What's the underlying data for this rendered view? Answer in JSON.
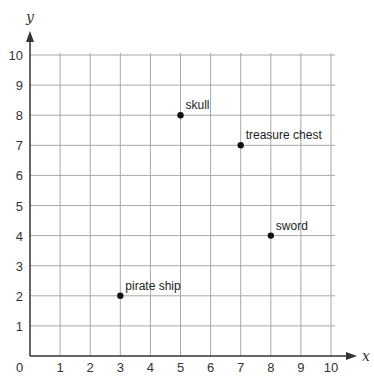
{
  "chart_data": {
    "type": "scatter",
    "title": "",
    "xlabel": "x",
    "ylabel": "y",
    "xlim": [
      0,
      10
    ],
    "ylim": [
      0,
      10
    ],
    "grid": true,
    "x_ticks": [
      "1",
      "2",
      "3",
      "4",
      "5",
      "6",
      "7",
      "8",
      "9",
      "10"
    ],
    "y_ticks": [
      "1",
      "2",
      "3",
      "4",
      "5",
      "6",
      "7",
      "8",
      "9",
      "10"
    ],
    "origin_label": "0",
    "points": [
      {
        "label": "skull",
        "x": 5,
        "y": 8
      },
      {
        "label": "treasure chest",
        "x": 7,
        "y": 7
      },
      {
        "label": "sword",
        "x": 8,
        "y": 4
      },
      {
        "label": "pirate ship",
        "x": 3,
        "y": 2
      }
    ]
  },
  "colors": {
    "grid": "#a8a8a8",
    "axis": "#333333",
    "point": "#111111"
  }
}
